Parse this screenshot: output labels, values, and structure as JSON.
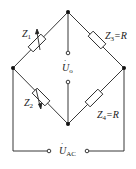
{
  "components": {
    "z1": {
      "sym": "Z",
      "sub": "1",
      "value": ""
    },
    "z2": {
      "sym": "Z",
      "sub": "2",
      "value": ""
    },
    "z3": {
      "sym": "Z",
      "sub": "3",
      "value": "=R"
    },
    "z4": {
      "sym": "Z",
      "sub": "4",
      "value": "=R"
    }
  },
  "output": {
    "sym": "U",
    "sub": "o"
  },
  "source": {
    "sym": "U",
    "sub": "AC"
  },
  "colors": {
    "line": "#222222",
    "background": "#ffffff"
  }
}
